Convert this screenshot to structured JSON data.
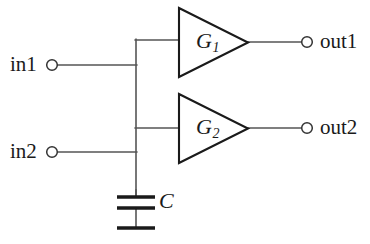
{
  "diagram": {
    "type": "electrical-schematic",
    "colors": {
      "background": "#ffffff",
      "wire": "#555555",
      "component_outline": "#1a1a1a",
      "text": "#1a1a1a"
    },
    "inputs": [
      {
        "id": "in1",
        "label": "in1",
        "terminal": "open-circle",
        "x": 52,
        "y": 65
      },
      {
        "id": "in2",
        "label": "in2",
        "terminal": "open-circle",
        "x": 52,
        "y": 152
      }
    ],
    "outputs": [
      {
        "id": "out1",
        "label": "out1",
        "terminal": "open-circle",
        "x": 307,
        "y": 42
      },
      {
        "id": "out2",
        "label": "out2",
        "terminal": "open-circle",
        "x": 307,
        "y": 128
      }
    ],
    "amplifiers": [
      {
        "id": "G1",
        "symbol": "G",
        "subscript": "1",
        "shape": "triangle",
        "input_y": 42,
        "output_y": 42
      },
      {
        "id": "G2",
        "symbol": "G",
        "subscript": "2",
        "shape": "triangle",
        "input_y": 128,
        "output_y": 128
      }
    ],
    "capacitor": {
      "id": "C",
      "label": "C",
      "symbol": "capacitor-with-ground"
    },
    "node": {
      "name": "shared-input-node",
      "x": 136
    }
  }
}
